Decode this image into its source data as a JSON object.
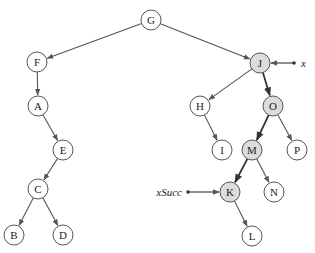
{
  "diagram": {
    "type": "binary-search-tree",
    "node_radius": 10,
    "colors": {
      "node_fill": "#ffffff",
      "highlight_fill": "#dcdcdc",
      "stroke": "#555555",
      "edge": "#555555",
      "text": "#222222"
    },
    "nodes": [
      {
        "id": "G",
        "label": "G",
        "x": 151,
        "y": 20,
        "highlighted": false
      },
      {
        "id": "F",
        "label": "F",
        "x": 37,
        "y": 62,
        "highlighted": false
      },
      {
        "id": "A",
        "label": "A",
        "x": 38,
        "y": 106,
        "highlighted": false
      },
      {
        "id": "E",
        "label": "E",
        "x": 63,
        "y": 150,
        "highlighted": false
      },
      {
        "id": "C",
        "label": "C",
        "x": 38,
        "y": 189,
        "highlighted": false
      },
      {
        "id": "B",
        "label": "B",
        "x": 14,
        "y": 235,
        "highlighted": false
      },
      {
        "id": "D",
        "label": "D",
        "x": 63,
        "y": 235,
        "highlighted": false
      },
      {
        "id": "J",
        "label": "J",
        "x": 260,
        "y": 63,
        "highlighted": true
      },
      {
        "id": "H",
        "label": "H",
        "x": 200,
        "y": 106,
        "highlighted": false
      },
      {
        "id": "O",
        "label": "O",
        "x": 273,
        "y": 106,
        "highlighted": true
      },
      {
        "id": "I",
        "label": "I",
        "x": 222,
        "y": 150,
        "highlighted": false
      },
      {
        "id": "M",
        "label": "M",
        "x": 252,
        "y": 150,
        "highlighted": true
      },
      {
        "id": "P",
        "label": "P",
        "x": 297,
        "y": 150,
        "highlighted": false
      },
      {
        "id": "K",
        "label": "K",
        "x": 230,
        "y": 192,
        "highlighted": true
      },
      {
        "id": "N",
        "label": "N",
        "x": 274,
        "y": 192,
        "highlighted": false
      },
      {
        "id": "L",
        "label": "L",
        "x": 252,
        "y": 236,
        "highlighted": false
      }
    ],
    "edges": [
      {
        "from": "G",
        "to": "F",
        "bold": false
      },
      {
        "from": "G",
        "to": "J",
        "bold": false
      },
      {
        "from": "F",
        "to": "A",
        "bold": false
      },
      {
        "from": "A",
        "to": "E",
        "bold": false
      },
      {
        "from": "E",
        "to": "C",
        "bold": false
      },
      {
        "from": "C",
        "to": "B",
        "bold": false
      },
      {
        "from": "C",
        "to": "D",
        "bold": false
      },
      {
        "from": "J",
        "to": "H",
        "bold": false
      },
      {
        "from": "J",
        "to": "O",
        "bold": true
      },
      {
        "from": "H",
        "to": "I",
        "bold": false
      },
      {
        "from": "O",
        "to": "M",
        "bold": true
      },
      {
        "from": "O",
        "to": "P",
        "bold": false
      },
      {
        "from": "M",
        "to": "K",
        "bold": true
      },
      {
        "from": "M",
        "to": "N",
        "bold": false
      },
      {
        "from": "K",
        "to": "L",
        "bold": false
      }
    ],
    "pointers": [
      {
        "label": "x",
        "target": "J",
        "side": "right",
        "label_x": 280,
        "label_y": 66,
        "dot_x": 294,
        "dot_y": 63
      },
      {
        "label": "xSucc",
        "target": "K",
        "side": "left",
        "label_x": 146,
        "label_y": 195,
        "dot_x": 188,
        "dot_y": 192
      }
    ]
  }
}
